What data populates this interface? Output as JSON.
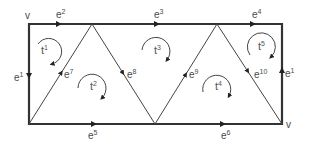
{
  "diagram": {
    "type": "triangulated rectangle (oriented edges and faces)",
    "colors": {
      "stroke": "#333333",
      "text": "#4a4a4a",
      "background": "#ffffff"
    },
    "vertex_label": "v",
    "vertices": {
      "A": [
        29,
        24
      ],
      "B": [
        92,
        24
      ],
      "C": [
        217,
        24
      ],
      "D": [
        282,
        24
      ],
      "E": [
        29,
        124
      ],
      "F": [
        155,
        124
      ],
      "G": [
        282,
        124
      ]
    },
    "edges": [
      {
        "id": "e1_left",
        "base": "e",
        "sup": "1",
        "from": "A",
        "to": "E",
        "direction": "down",
        "weight": "bold"
      },
      {
        "id": "e2",
        "base": "e",
        "sup": "2",
        "from": "A",
        "to": "B",
        "direction": "right",
        "weight": "bold"
      },
      {
        "id": "e3",
        "base": "e",
        "sup": "3",
        "from": "B",
        "to": "C",
        "direction": "right",
        "weight": "bold"
      },
      {
        "id": "e4",
        "base": "e",
        "sup": "4",
        "from": "C",
        "to": "D",
        "direction": "right",
        "weight": "bold"
      },
      {
        "id": "e1_right",
        "base": "e",
        "sup": "1",
        "from": "G",
        "to": "D",
        "direction": "up",
        "weight": "bold"
      },
      {
        "id": "e5",
        "base": "e",
        "sup": "5",
        "from": "E",
        "to": "F",
        "direction": "right",
        "weight": "bold"
      },
      {
        "id": "e6",
        "base": "e",
        "sup": "6",
        "from": "F",
        "to": "G",
        "direction": "right",
        "weight": "bold"
      },
      {
        "id": "e7",
        "base": "e",
        "sup": "7",
        "from": "E",
        "to": "B",
        "direction": "up",
        "weight": "thin"
      },
      {
        "id": "e8",
        "base": "e",
        "sup": "8",
        "from": "B",
        "to": "F",
        "direction": "down",
        "weight": "thin"
      },
      {
        "id": "e9",
        "base": "e",
        "sup": "9",
        "from": "F",
        "to": "C",
        "direction": "up",
        "weight": "thin"
      },
      {
        "id": "e10",
        "base": "e",
        "sup": "10",
        "from": "C",
        "to": "G",
        "direction": "down",
        "weight": "thin"
      }
    ],
    "faces": [
      {
        "id": "t1",
        "base": "t",
        "sup": "1",
        "orientation": "clockwise"
      },
      {
        "id": "t2",
        "base": "t",
        "sup": "2",
        "orientation": "clockwise"
      },
      {
        "id": "t3",
        "base": "t",
        "sup": "3",
        "orientation": "clockwise"
      },
      {
        "id": "t4",
        "base": "t",
        "sup": "4",
        "orientation": "clockwise"
      },
      {
        "id": "t5",
        "base": "t",
        "sup": "5",
        "orientation": "clockwise"
      }
    ]
  }
}
